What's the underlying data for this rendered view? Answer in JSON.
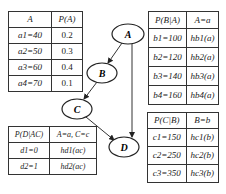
{
  "diagram": {
    "type": "bayesian-network",
    "nodes": [
      {
        "id": "A",
        "label": "A",
        "cx": 128,
        "cy": 34
      },
      {
        "id": "B",
        "label": "B",
        "cx": 102,
        "cy": 73
      },
      {
        "id": "C",
        "label": "C",
        "cx": 77,
        "cy": 109
      },
      {
        "id": "D",
        "label": "D",
        "cx": 124,
        "cy": 147
      }
    ],
    "edges": [
      {
        "from": "A",
        "to": "B"
      },
      {
        "from": "B",
        "to": "C"
      },
      {
        "from": "C",
        "to": "D"
      },
      {
        "from": "A",
        "to": "D"
      }
    ]
  },
  "tables": {
    "pa": {
      "headers": [
        "A",
        "P(A)"
      ],
      "rows": [
        [
          "a1=40",
          "0.2"
        ],
        [
          "a2=50",
          "0.3"
        ],
        [
          "a3=60",
          "0.4"
        ],
        [
          "a4=70",
          "0.1"
        ]
      ]
    },
    "pba": {
      "headers": [
        "P(B|A)",
        "A=a"
      ],
      "rows": [
        [
          "b1=100",
          "hb1(a)"
        ],
        [
          "b2=120",
          "hb2(a)"
        ],
        [
          "b3=140",
          "hb3(a)"
        ],
        [
          "b4=160",
          "hb4(a)"
        ]
      ]
    },
    "pdac": {
      "headers": [
        "P(D|AC)",
        "A=a, C=c"
      ],
      "rows": [
        [
          "d1=0",
          "hd1(ac)"
        ],
        [
          "d2=1",
          "hd2(ac)"
        ]
      ]
    },
    "pcb": {
      "headers": [
        "P(C|B)",
        "B=b"
      ],
      "rows": [
        [
          "c1=150",
          "hc1(b)"
        ],
        [
          "c2=250",
          "hc2(b)"
        ],
        [
          "c3=350",
          "hc3(b)"
        ]
      ]
    }
  }
}
